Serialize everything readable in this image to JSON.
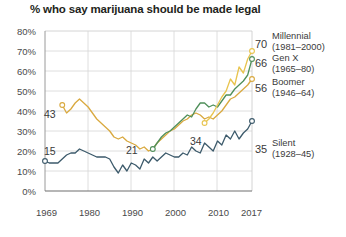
{
  "chart_data": {
    "type": "line",
    "title": "% who say marijuana should be made legal",
    "xlabel": "",
    "ylabel": "",
    "xlim": [
      1969,
      2017
    ],
    "ylim": [
      0,
      80
    ],
    "grid": true,
    "legend_position": "right",
    "x_ticks": [
      "1969",
      "1980",
      "1990",
      "2000",
      "2010",
      "2017"
    ],
    "x_tick_values": [
      1969,
      1980,
      1990,
      2000,
      2010,
      2017
    ],
    "y_ticks": [
      "0%",
      "10%",
      "20%",
      "30%",
      "40%",
      "50%",
      "60%",
      "70%",
      "80%"
    ],
    "y_tick_values": [
      0,
      10,
      20,
      30,
      40,
      50,
      60,
      70,
      80
    ],
    "series": [
      {
        "name": "Millennial",
        "years": "(1981–2000)",
        "color": "#e8c44e",
        "start_label": "34",
        "end_label": "70",
        "x": [
          2006,
          2007,
          2008,
          2009,
          2010,
          2011,
          2012,
          2013,
          2014,
          2015,
          2016,
          2017
        ],
        "values": [
          34,
          36,
          39,
          43,
          47,
          50,
          56,
          53,
          62,
          59,
          66,
          70
        ]
      },
      {
        "name": "Gen X",
        "years": "(1965–80)",
        "color": "#4f8f5a",
        "start_label": "21",
        "end_label": "66",
        "x": [
          1994,
          1995,
          1996,
          1997,
          1998,
          1999,
          2000,
          2001,
          2002,
          2003,
          2004,
          2005,
          2006,
          2007,
          2008,
          2009,
          2010,
          2011,
          2012,
          2013,
          2014,
          2015,
          2016,
          2017
        ],
        "values": [
          21,
          24,
          27,
          29,
          30,
          32,
          34,
          36,
          38,
          37,
          41,
          44,
          44,
          42,
          43,
          42,
          45,
          48,
          48,
          51,
          53,
          55,
          58,
          66
        ]
      },
      {
        "name": "Boomer",
        "years": "(1946–64)",
        "color": "#d9a93f",
        "start_label": "43",
        "end_label": "56",
        "x": [
          1973,
          1974,
          1975,
          1976,
          1977,
          1978,
          1979,
          1980,
          1981,
          1982,
          1983,
          1984,
          1985,
          1986,
          1987,
          1988,
          1989,
          1990,
          1991,
          1992,
          1993,
          1994,
          1995,
          1996,
          1997,
          1998,
          1999,
          2000,
          2001,
          2002,
          2003,
          2004,
          2005,
          2006,
          2007,
          2008,
          2009,
          2010,
          2011,
          2012,
          2013,
          2014,
          2015,
          2016,
          2017
        ],
        "values": [
          43,
          39,
          41,
          44,
          46,
          44,
          42,
          39,
          36,
          34,
          32,
          30,
          27,
          26,
          27,
          25,
          24,
          23,
          21,
          22,
          20,
          21,
          24,
          26,
          28,
          30,
          31,
          33,
          35,
          36,
          38,
          39,
          38,
          36,
          37,
          36,
          38,
          40,
          43,
          46,
          47,
          49,
          51,
          53,
          56
        ]
      },
      {
        "name": "Silent",
        "years": "(1928–45)",
        "color": "#3c5a6b",
        "start_label": "15",
        "end_label": "35",
        "x": [
          1969,
          1970,
          1971,
          1972,
          1973,
          1974,
          1975,
          1976,
          1977,
          1978,
          1979,
          1980,
          1981,
          1982,
          1983,
          1984,
          1985,
          1986,
          1987,
          1988,
          1989,
          1990,
          1991,
          1992,
          1993,
          1994,
          1995,
          1996,
          1997,
          1998,
          1999,
          2000,
          2001,
          2002,
          2003,
          2004,
          2005,
          2006,
          2007,
          2008,
          2009,
          2010,
          2011,
          2012,
          2013,
          2014,
          2015,
          2016,
          2017
        ],
        "values": [
          15,
          14,
          14,
          14,
          16,
          18,
          19,
          19,
          21,
          20,
          19,
          18,
          17,
          17,
          17,
          16,
          12,
          9,
          13,
          10,
          14,
          13,
          11,
          16,
          14,
          17,
          15,
          17,
          19,
          18,
          17,
          17,
          19,
          18,
          22,
          20,
          19,
          24,
          22,
          20,
          25,
          23,
          28,
          26,
          30,
          26,
          29,
          31,
          35
        ]
      }
    ]
  },
  "legend": [
    {
      "name": "Millennial",
      "years": "(1981–2000)",
      "value": "70"
    },
    {
      "name": "Gen X",
      "years": "(1965–80)",
      "value": "66"
    },
    {
      "name": "Boomer",
      "years": "(1946–64)",
      "value": "56"
    },
    {
      "name": "Silent",
      "years": "(1928–45)",
      "value": "35"
    }
  ],
  "annotations": [
    {
      "label": "43"
    },
    {
      "label": "21"
    },
    {
      "label": "34"
    },
    {
      "label": "15"
    }
  ]
}
